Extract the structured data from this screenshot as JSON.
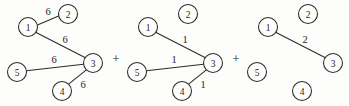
{
  "figure": {
    "type": "graph-decomposition-diagram",
    "operators": [
      {
        "symbol": "+",
        "x": 116,
        "y": 58
      },
      {
        "symbol": "+",
        "x": 236,
        "y": 58
      }
    ],
    "graphs": [
      {
        "id": "graph-1",
        "nodes": [
          {
            "id": "1",
            "label": "1",
            "cx": 28,
            "cy": 27,
            "r": 9.5
          },
          {
            "id": "2",
            "label": "2",
            "cx": 68,
            "cy": 14,
            "r": 9.5
          },
          {
            "id": "3",
            "label": "3",
            "cx": 93,
            "cy": 63,
            "r": 9.5
          },
          {
            "id": "4",
            "label": "4",
            "cx": 62,
            "cy": 91,
            "r": 9.5
          },
          {
            "id": "5",
            "label": "5",
            "cx": 17,
            "cy": 72,
            "r": 9.5
          }
        ],
        "edges": [
          {
            "from": "1",
            "to": "2",
            "weight": "6",
            "x1": 37.4,
            "y1": 25.1,
            "x2": 58.6,
            "y2": 15.9,
            "lx": 48,
            "ly": 11
          },
          {
            "from": "1",
            "to": "3",
            "weight": "6",
            "x1": 35.6,
            "y1": 32.2,
            "x2": 85.4,
            "y2": 57.8,
            "lx": 65,
            "ly": 39
          },
          {
            "from": "5",
            "to": "3",
            "weight": "6",
            "x1": 26.4,
            "y1": 70.7,
            "x2": 83.6,
            "y2": 64.3,
            "lx": 54,
            "ly": 59
          },
          {
            "from": "4",
            "to": "3",
            "weight": "6",
            "x1": 68.6,
            "y1": 84.2,
            "x2": 86.4,
            "y2": 69.8,
            "lx": 83,
            "ly": 84
          }
        ]
      },
      {
        "id": "graph-2",
        "nodes": [
          {
            "id": "1",
            "label": "1",
            "cx": 148,
            "cy": 27,
            "r": 9.5
          },
          {
            "id": "2",
            "label": "2",
            "cx": 188,
            "cy": 14,
            "r": 9.5
          },
          {
            "id": "3",
            "label": "3",
            "cx": 213,
            "cy": 63,
            "r": 9.5
          },
          {
            "id": "4",
            "label": "4",
            "cx": 182,
            "cy": 91,
            "r": 9.5
          },
          {
            "id": "5",
            "label": "5",
            "cx": 137,
            "cy": 72,
            "r": 9.5
          }
        ],
        "edges": [
          {
            "from": "1",
            "to": "3",
            "weight": "1",
            "x1": 155.6,
            "y1": 32.2,
            "x2": 205.4,
            "y2": 57.8,
            "lx": 185,
            "ly": 39
          },
          {
            "from": "5",
            "to": "3",
            "weight": "1",
            "x1": 146.4,
            "y1": 70.7,
            "x2": 203.6,
            "y2": 64.3,
            "lx": 174,
            "ly": 59
          },
          {
            "from": "4",
            "to": "3",
            "weight": "1",
            "x1": 188.6,
            "y1": 84.2,
            "x2": 206.4,
            "y2": 69.8,
            "lx": 203,
            "ly": 84
          }
        ]
      },
      {
        "id": "graph-3",
        "nodes": [
          {
            "id": "1",
            "label": "1",
            "cx": 268,
            "cy": 27,
            "r": 9.5
          },
          {
            "id": "2",
            "label": "2",
            "cx": 308,
            "cy": 14,
            "r": 9.5
          },
          {
            "id": "3",
            "label": "3",
            "cx": 333,
            "cy": 63,
            "r": 9.5
          },
          {
            "id": "4",
            "label": "4",
            "cx": 302,
            "cy": 91,
            "r": 9.5
          },
          {
            "id": "5",
            "label": "5",
            "cx": 257,
            "cy": 72,
            "r": 9.5
          }
        ],
        "edges": [
          {
            "from": "1",
            "to": "3",
            "weight": "2",
            "x1": 275.6,
            "y1": 32.2,
            "x2": 325.4,
            "y2": 57.8,
            "lx": 305,
            "ly": 39
          }
        ]
      }
    ]
  }
}
